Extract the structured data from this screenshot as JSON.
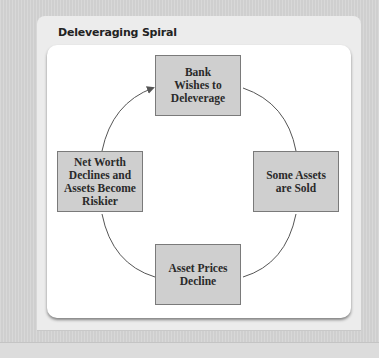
{
  "panel": {
    "title": "Deleveraging Spiral"
  },
  "diagram": {
    "type": "cycle",
    "nodes": [
      {
        "id": "top",
        "lines": [
          "Bank",
          "Wishes to",
          "Deleverage"
        ]
      },
      {
        "id": "right",
        "lines": [
          "Some Assets",
          "are Sold"
        ]
      },
      {
        "id": "bottom",
        "lines": [
          "Asset Prices",
          "Decline"
        ]
      },
      {
        "id": "left",
        "lines": [
          "Net Worth",
          "Declines and",
          "Assets Become",
          "Riskier"
        ]
      }
    ],
    "edges": [
      {
        "from": "top",
        "to": "right",
        "arrow": false
      },
      {
        "from": "right",
        "to": "bottom",
        "arrow": false
      },
      {
        "from": "bottom",
        "to": "left",
        "arrow": false
      },
      {
        "from": "left",
        "to": "top",
        "arrow": true
      }
    ],
    "colors": {
      "node_fill": "#cfcfcf",
      "node_border": "#7a7a7a",
      "edge": "#555555",
      "card": "#ffffff",
      "panel": "#ececec",
      "background": "#d6d6d6"
    }
  }
}
